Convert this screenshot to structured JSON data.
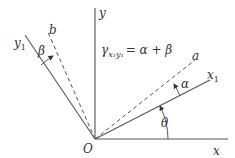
{
  "diagram": {
    "origin_label": "O",
    "axes": {
      "x": "x",
      "y": "y",
      "x1": "x",
      "x1_sub": "1",
      "y1": "y",
      "y1_sub": "1"
    },
    "lines": {
      "a": "a",
      "b": "b"
    },
    "angles": {
      "theta": "θ",
      "alpha": "α",
      "beta": "β"
    },
    "formula": {
      "gamma": "γ",
      "subscript": "x₁y₁",
      "rhs": "= α + β"
    },
    "colors": {
      "line": "#444444",
      "text": "#333333"
    }
  }
}
